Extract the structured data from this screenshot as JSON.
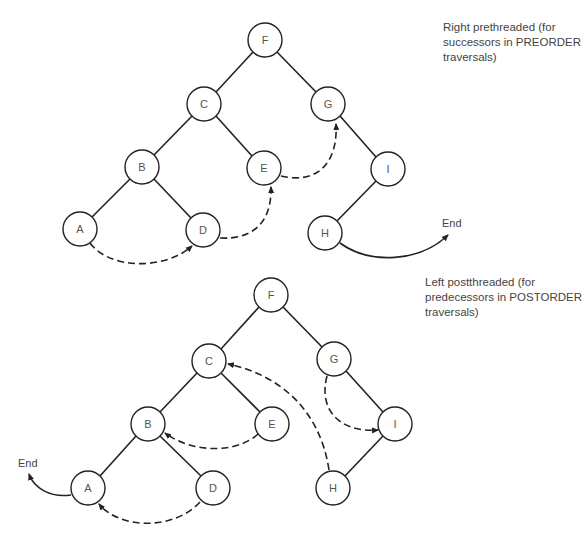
{
  "diagrams": [
    {
      "id": "right-prethreaded",
      "caption": [
        "Right prethreaded (for",
        "successors in PREORDER",
        "traversals)"
      ],
      "end_label": "End",
      "nodes": {
        "F": [
          265,
          40
        ],
        "C": [
          204,
          104
        ],
        "G": [
          328,
          104
        ],
        "B": [
          142,
          167
        ],
        "E": [
          264,
          168
        ],
        "I": [
          388,
          169
        ],
        "A": [
          80,
          229
        ],
        "D": [
          203,
          230
        ],
        "H": [
          325,
          233
        ]
      },
      "edges": [
        [
          "F",
          "C"
        ],
        [
          "F",
          "G"
        ],
        [
          "C",
          "B"
        ],
        [
          "C",
          "E"
        ],
        [
          "B",
          "A"
        ],
        [
          "B",
          "D"
        ],
        [
          "G",
          "I"
        ],
        [
          "I",
          "H"
        ]
      ],
      "threads": [
        {
          "from": "A",
          "to": "D"
        },
        {
          "from": "D",
          "to": "E"
        },
        {
          "from": "E",
          "to": "G"
        },
        {
          "from": "H",
          "to": "End"
        }
      ]
    },
    {
      "id": "left-postthreaded",
      "caption": [
        "Left postthreaded (for",
        "predecessors in POSTORDER",
        "traversals)"
      ],
      "end_label": "End",
      "nodes": {
        "F": [
          271,
          295
        ],
        "C": [
          209,
          361
        ],
        "G": [
          334,
          359
        ],
        "B": [
          148,
          424
        ],
        "E": [
          272,
          424
        ],
        "I": [
          395,
          424
        ],
        "A": [
          88,
          488
        ],
        "D": [
          213,
          488
        ],
        "H": [
          333,
          488
        ]
      },
      "edges": [
        [
          "F",
          "C"
        ],
        [
          "F",
          "G"
        ],
        [
          "C",
          "B"
        ],
        [
          "C",
          "E"
        ],
        [
          "B",
          "A"
        ],
        [
          "B",
          "D"
        ],
        [
          "G",
          "I"
        ],
        [
          "I",
          "H"
        ]
      ],
      "threads": [
        {
          "from": "D",
          "to": "A"
        },
        {
          "from": "E",
          "to": "B"
        },
        {
          "from": "H",
          "to": "C"
        },
        {
          "from": "G",
          "to": "I"
        },
        {
          "from": "A",
          "to": "End"
        }
      ]
    }
  ]
}
